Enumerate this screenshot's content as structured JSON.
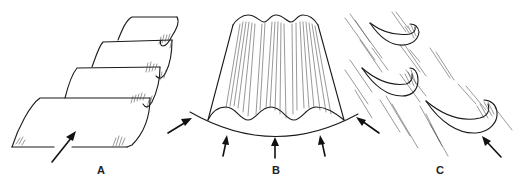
{
  "figure": {
    "panels": [
      {
        "id": "A",
        "label": "A",
        "subject": "corrugated sheets stacked in series",
        "arrows": 1
      },
      {
        "id": "B",
        "label": "B",
        "subject": "curved corrugated panel with arc and radial arrows",
        "arrows": 5
      },
      {
        "id": "C",
        "label": "C",
        "subject": "curved vanes in streaked flow",
        "arrows": 1
      }
    ],
    "colors": {
      "ink": "#1a1a1a",
      "background": "#ffffff"
    }
  }
}
